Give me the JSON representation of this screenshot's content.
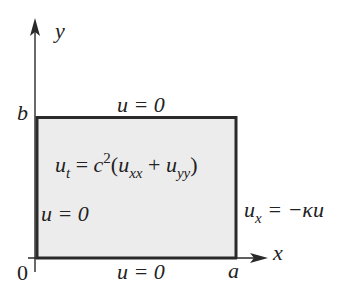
{
  "diagram": {
    "type": "domain-with-boundary-conditions",
    "colors": {
      "stroke": "#2a2a2a",
      "fill": "#ececec",
      "background": "#ffffff"
    },
    "axes": {
      "x_label": "x",
      "y_label": "y",
      "origin_label": "0",
      "x_tick_label": "a",
      "y_tick_label": "b"
    },
    "region": {
      "equation": {
        "lhs": "u",
        "lhs_sub": "t",
        "eq": " = ",
        "coef": "c",
        "coef_sup": "2",
        "open": "(",
        "term1": "u",
        "term1_sub": "xx",
        "plus": " + ",
        "term2": "u",
        "term2_sub": "yy",
        "close": ")"
      }
    },
    "boundary_conditions": {
      "top": "u = 0",
      "left": "u = 0",
      "bottom": "u = 0",
      "right": {
        "var": "u",
        "sub": "x",
        "rest": " = −κu"
      }
    }
  }
}
